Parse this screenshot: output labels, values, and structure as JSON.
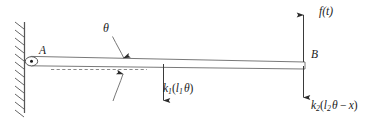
{
  "figure": {
    "type": "free-body-diagram",
    "canvas": {
      "width": 379,
      "height": 127,
      "background": "#ffffff"
    },
    "stroke_color": "#4d4d4d",
    "text_color": "#1a1a1a"
  },
  "labels": {
    "pivot_point": "A",
    "end_point": "B",
    "angle": "θ",
    "applied_force": "f(t)",
    "spring_force_left": {
      "symbol": "k",
      "symbol_sub": "1",
      "arg_open": "(",
      "arg_symbol": "l",
      "arg_sub": "1",
      "arg_theta": "θ",
      "arg_close": ")",
      "full": "k1(l1θ)"
    },
    "spring_force_right": {
      "symbol": "k",
      "symbol_sub": "2",
      "arg_open": "(",
      "arg_symbol": "l",
      "arg_sub": "2",
      "arg_theta": "θ",
      "arg_minus": "−",
      "arg_x": "x",
      "arg_close": ")",
      "full": "k2(l2θ − x)"
    }
  },
  "elements": {
    "wall": "fixed-support-hatched-wall",
    "beam": "rigid-beam",
    "pivot": "pin-joint",
    "reference_line": "dashed-horizontal-datum",
    "angle_arc": "double-headed-curved-arrow",
    "force_arrow_k1": "downward-arrow",
    "force_arrow_ft": "upward-arrow",
    "force_arrow_k2": "downward-arrow"
  }
}
